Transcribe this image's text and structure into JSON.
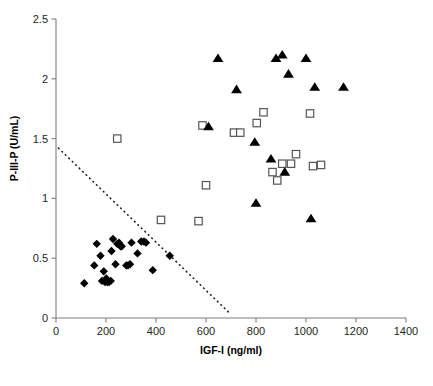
{
  "chart_data": {
    "type": "scatter",
    "title": "",
    "xlabel": "IGF-I (ng/ml)",
    "ylabel": "P-III-P (U/mL)",
    "xlim": [
      0,
      1400
    ],
    "ylim": [
      0,
      2.5
    ],
    "xticks": [
      0,
      200,
      400,
      600,
      800,
      1000,
      1200,
      1400
    ],
    "xticklabels": [
      "0",
      "200",
      "400",
      "600",
      "800",
      "1000",
      "1200",
      "1400"
    ],
    "yticks": [
      0,
      0.5,
      1,
      1.5,
      2,
      2.5
    ],
    "yticklabels": [
      "0",
      "0.5",
      "1",
      "1.5",
      "2",
      "2.5"
    ],
    "grid": false,
    "legend": null,
    "annotations": [
      {
        "name": "decision-threshold-line",
        "style": "dotted",
        "x_start": 10,
        "y_start": 1.42,
        "x_end": 690,
        "y_end": 0.05
      }
    ],
    "series": [
      {
        "name": "diamonds",
        "marker": "diamond",
        "color": "#000000",
        "points": [
          [
            113,
            0.29
          ],
          [
            153,
            0.44
          ],
          [
            163,
            0.62
          ],
          [
            178,
            0.52
          ],
          [
            184,
            0.31
          ],
          [
            191,
            0.39
          ],
          [
            196,
            0.3
          ],
          [
            201,
            0.33
          ],
          [
            205,
            0.3
          ],
          [
            212,
            0.3
          ],
          [
            219,
            0.31
          ],
          [
            222,
            0.56
          ],
          [
            228,
            0.66
          ],
          [
            238,
            0.45
          ],
          [
            245,
            0.62
          ],
          [
            252,
            0.63
          ],
          [
            258,
            0.6
          ],
          [
            263,
            0.6
          ],
          [
            281,
            0.44
          ],
          [
            288,
            0.44
          ],
          [
            296,
            0.45
          ],
          [
            302,
            0.63
          ],
          [
            326,
            0.54
          ],
          [
            341,
            0.64
          ],
          [
            352,
            0.64
          ],
          [
            360,
            0.63
          ],
          [
            387,
            0.4
          ],
          [
            455,
            0.52
          ]
        ]
      },
      {
        "name": "open-squares",
        "marker": "square",
        "color": "#555555",
        "points": [
          [
            245,
            1.5
          ],
          [
            420,
            0.82
          ],
          [
            570,
            0.81
          ],
          [
            586,
            1.61
          ],
          [
            600,
            1.11
          ],
          [
            712,
            1.55
          ],
          [
            737,
            1.55
          ],
          [
            803,
            1.63
          ],
          [
            830,
            1.72
          ],
          [
            866,
            1.22
          ],
          [
            885,
            1.15
          ],
          [
            905,
            1.29
          ],
          [
            940,
            1.29
          ],
          [
            960,
            1.37
          ],
          [
            1016,
            1.71
          ],
          [
            1028,
            1.27
          ],
          [
            1060,
            1.28
          ]
        ]
      },
      {
        "name": "filled-triangles",
        "marker": "triangle",
        "color": "#000000",
        "points": [
          [
            610,
            1.6
          ],
          [
            648,
            2.17
          ],
          [
            722,
            1.91
          ],
          [
            795,
            1.47
          ],
          [
            800,
            0.96
          ],
          [
            860,
            1.33
          ],
          [
            880,
            2.17
          ],
          [
            905,
            2.2
          ],
          [
            915,
            1.22
          ],
          [
            930,
            2.04
          ],
          [
            1000,
            2.17
          ],
          [
            1020,
            0.83
          ],
          [
            1035,
            1.93
          ],
          [
            1150,
            1.93
          ]
        ]
      }
    ]
  }
}
